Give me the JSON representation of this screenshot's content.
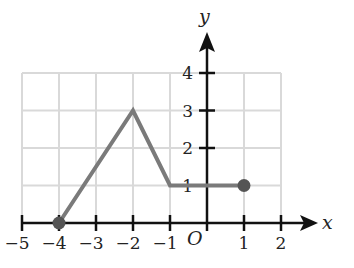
{
  "chart_data": {
    "type": "line",
    "title": "",
    "xlabel": "x",
    "ylabel": "y",
    "origin_label": "O",
    "xlim": [
      -5,
      2
    ],
    "ylim": [
      0,
      4
    ],
    "grid": true,
    "x_ticks": [
      "−5",
      "−4",
      "−3",
      "−2",
      "−1",
      "1",
      "2"
    ],
    "y_ticks": [
      "1",
      "2",
      "3",
      "4"
    ],
    "series": [
      {
        "name": "f(x)",
        "x": [
          -4,
          -2,
          -1,
          1
        ],
        "y": [
          0,
          3,
          1,
          1
        ],
        "endpoints": [
          {
            "x": -4,
            "y": 0,
            "closed": true
          },
          {
            "x": 1,
            "y": 1,
            "closed": true
          }
        ]
      }
    ],
    "colors": {
      "line": "#7a7a7a",
      "grid": "#d9d9d9",
      "axis": "#111111",
      "point": "#555555"
    }
  }
}
